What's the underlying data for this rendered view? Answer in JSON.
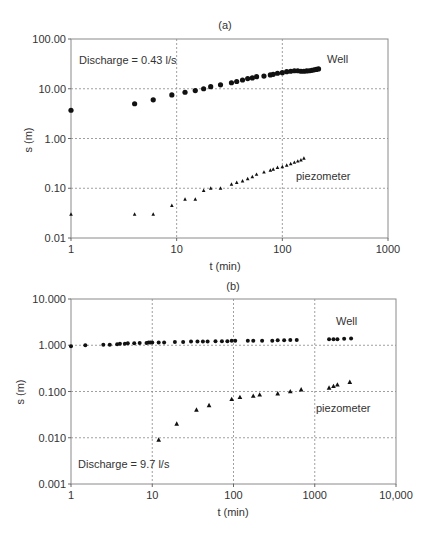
{
  "chart_data": [
    {
      "type": "scatter",
      "panel_label": "(a)",
      "title": "(a)",
      "xlabel": "t (min)",
      "ylabel": "s (m)",
      "xscale": "log",
      "yscale": "log",
      "xlim": [
        1,
        1000
      ],
      "ylim": [
        0.01,
        100
      ],
      "x_ticks": [
        "1",
        "10",
        "100",
        "1000"
      ],
      "y_ticks": [
        "100.00",
        "10.00",
        "1.00",
        "0.10",
        "0.01"
      ],
      "grid": true,
      "annotation": "Discharge = 0.43 l/s",
      "series": [
        {
          "name": "Well",
          "marker": "circle",
          "x": [
            1,
            4,
            6,
            9,
            12,
            15,
            18,
            21,
            26,
            33,
            37,
            42,
            47,
            52,
            57,
            67,
            77,
            82,
            90,
            100,
            110,
            120,
            130,
            140,
            150,
            160,
            170,
            180,
            190,
            200,
            210,
            220
          ],
          "y": [
            3.7,
            5.0,
            6.0,
            7.5,
            8.5,
            9.2,
            10.0,
            11.0,
            12.0,
            13.2,
            14.0,
            15.0,
            16.0,
            16.5,
            17.5,
            18.0,
            19.0,
            19.5,
            20.5,
            21.0,
            22.0,
            22.5,
            23.0,
            23.0,
            22.5,
            22.5,
            22.8,
            23.0,
            23.5,
            24.0,
            24.5,
            25.0
          ]
        },
        {
          "name": "piezometer",
          "marker": "triangle",
          "x": [
            1,
            4,
            6,
            9,
            12,
            15,
            18,
            21,
            26,
            33,
            37,
            42,
            47,
            52,
            57,
            67,
            77,
            82,
            90,
            100,
            110,
            120,
            130,
            140,
            150,
            160
          ],
          "y": [
            0.03,
            0.03,
            0.03,
            0.045,
            0.06,
            0.06,
            0.09,
            0.1,
            0.1,
            0.12,
            0.13,
            0.14,
            0.155,
            0.17,
            0.19,
            0.21,
            0.23,
            0.24,
            0.26,
            0.27,
            0.29,
            0.31,
            0.33,
            0.35,
            0.37,
            0.4
          ]
        }
      ]
    },
    {
      "type": "scatter",
      "panel_label": "(b)",
      "title": "(b)",
      "xlabel": "t (min)",
      "ylabel": "s (m)",
      "xscale": "log",
      "yscale": "log",
      "xlim": [
        1,
        10000
      ],
      "ylim": [
        0.001,
        10
      ],
      "x_ticks": [
        "1",
        "10",
        "100",
        "1000",
        "10,000"
      ],
      "y_ticks": [
        "10.000",
        "1.000",
        "0.100",
        "0.010",
        "0.001"
      ],
      "grid": true,
      "annotation": "Discharge = 9.7 l/s",
      "series": [
        {
          "name": "Well",
          "marker": "circle",
          "x": [
            1,
            1.5,
            2.5,
            3,
            3.7,
            4,
            4.6,
            5,
            6,
            7,
            8.5,
            9,
            9.5,
            10,
            12,
            14,
            19,
            24,
            30,
            36,
            42,
            48,
            60,
            72,
            84,
            95,
            105,
            150,
            175,
            225,
            300,
            350,
            420,
            500,
            600,
            1500,
            1700,
            1900,
            2300,
            2800
          ],
          "y": [
            0.95,
            1.0,
            1.02,
            1.02,
            1.05,
            1.08,
            1.08,
            1.1,
            1.1,
            1.12,
            1.12,
            1.15,
            1.15,
            1.15,
            1.15,
            1.15,
            1.18,
            1.18,
            1.2,
            1.2,
            1.2,
            1.2,
            1.22,
            1.22,
            1.22,
            1.25,
            1.25,
            1.25,
            1.25,
            1.25,
            1.25,
            1.28,
            1.28,
            1.3,
            1.3,
            1.35,
            1.35,
            1.35,
            1.38,
            1.4
          ]
        },
        {
          "name": "piezometer",
          "marker": "triangle",
          "x": [
            12,
            20,
            35,
            50,
            95,
            120,
            175,
            210,
            350,
            500,
            680,
            1500,
            1700,
            1900,
            2700
          ],
          "y": [
            0.009,
            0.02,
            0.04,
            0.05,
            0.068,
            0.075,
            0.08,
            0.085,
            0.09,
            0.1,
            0.11,
            0.12,
            0.13,
            0.14,
            0.16
          ]
        }
      ]
    }
  ],
  "panels": {
    "a": {
      "title": "(a)",
      "xlabel": "t (min)",
      "ylabel": "s (m)",
      "annotation": "Discharge = 0.43 l/s",
      "well_label": "Well",
      "piezo_label": "piezometer",
      "x_ticks": [
        "1",
        "10",
        "100",
        "1000"
      ],
      "y_ticks": [
        "100.00",
        "10.00",
        "1.00",
        "0.10",
        "0.01"
      ]
    },
    "b": {
      "title": "(b)",
      "xlabel": "t (min)",
      "ylabel": "s (m)",
      "annotation": "Discharge = 9.7 l/s",
      "well_label": "Well",
      "piezo_label": "piezometer",
      "x_ticks": [
        "1",
        "10",
        "100",
        "1000",
        "10,000"
      ],
      "y_ticks": [
        "10.000",
        "1.000",
        "0.100",
        "0.010",
        "0.001"
      ]
    }
  },
  "colors": {
    "marker": "#111111",
    "axis": "#666666",
    "grid": "#888888",
    "text": "#333333"
  }
}
